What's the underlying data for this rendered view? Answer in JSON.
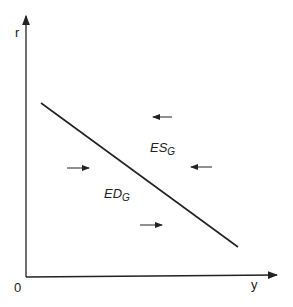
{
  "axes": {
    "y_label": "r",
    "x_label": "y",
    "origin_label": "0"
  },
  "curve": {
    "name": "goods market equilibrium line",
    "from": [
      41,
      103
    ],
    "to": [
      238,
      247
    ]
  },
  "regions": {
    "excess_supply": {
      "main": "ES",
      "sub": "G"
    },
    "excess_demand": {
      "main": "ED",
      "sub": "G"
    }
  },
  "arrows": [
    {
      "direction": "left",
      "x1": 172,
      "y1": 117,
      "x2": 152,
      "y2": 117
    },
    {
      "direction": "left",
      "x1": 212,
      "y1": 167,
      "x2": 190,
      "y2": 167
    },
    {
      "direction": "right",
      "x1": 67,
      "y1": 168,
      "x2": 90,
      "y2": 168
    },
    {
      "direction": "right",
      "x1": 140,
      "y1": 225,
      "x2": 163,
      "y2": 225
    }
  ]
}
